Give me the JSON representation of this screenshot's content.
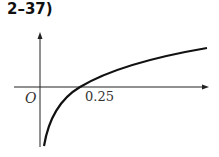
{
  "problem_label": "2–37)",
  "diagram": {
    "origin_label": "O",
    "x_intercept_label": "0.25",
    "curve": "logarithmic-like increasing curve crossing x-axis at 0.25"
  }
}
